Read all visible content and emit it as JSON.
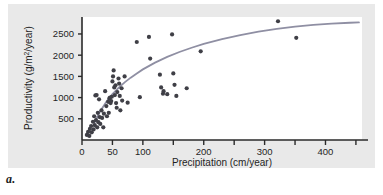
{
  "figure": {
    "panel_label": "a.",
    "background_color": "#e9e9e9",
    "plot_background_color": "#ffffff"
  },
  "chart_data": {
    "type": "scatter",
    "title": "",
    "xlabel": "Precipitation (cm/year)",
    "ylabel_parts": {
      "before": "Productivity (g/m",
      "superscript": "2",
      "after": "/year)"
    },
    "ylabel": "Productivity (g/m2/year)",
    "xlim": [
      0,
      460
    ],
    "ylim": [
      0,
      2900
    ],
    "grid": false,
    "legend": "none",
    "xticks": [
      0,
      50,
      100,
      150,
      200,
      250,
      300,
      350,
      400,
      450
    ],
    "xtick_labels": [
      "0",
      "50",
      "100",
      "",
      "200",
      "",
      "300",
      "",
      "400",
      ""
    ],
    "yticks": [
      500,
      1000,
      1500,
      2000,
      2500
    ],
    "ytick_labels": [
      "500",
      "1000",
      "1500",
      "2000",
      "2500"
    ],
    "point_color": "#3f3f46",
    "point_radius": 2.1,
    "curve_color": "#8f8fa3",
    "curve_width": 1.8,
    "axis_color": "#2a2a2a",
    "points": [
      [
        8,
        120
      ],
      [
        10,
        190
      ],
      [
        12,
        95
      ],
      [
        13,
        260
      ],
      [
        15,
        330
      ],
      [
        16,
        180
      ],
      [
        18,
        430
      ],
      [
        19,
        250
      ],
      [
        20,
        560
      ],
      [
        21,
        350
      ],
      [
        22,
        1050
      ],
      [
        23,
        470
      ],
      [
        24,
        1060
      ],
      [
        25,
        300
      ],
      [
        26,
        640
      ],
      [
        27,
        420
      ],
      [
        28,
        960
      ],
      [
        29,
        540
      ],
      [
        30,
        380
      ],
      [
        32,
        700
      ],
      [
        33,
        520
      ],
      [
        35,
        300
      ],
      [
        36,
        620
      ],
      [
        38,
        1150
      ],
      [
        40,
        800
      ],
      [
        41,
        560
      ],
      [
        43,
        900
      ],
      [
        44,
        640
      ],
      [
        45,
        980
      ],
      [
        46,
        1000
      ],
      [
        47,
        870
      ],
      [
        48,
        920
      ],
      [
        49,
        1020
      ],
      [
        50,
        1380
      ],
      [
        51,
        1500
      ],
      [
        52,
        1640
      ],
      [
        53,
        1240
      ],
      [
        54,
        1060
      ],
      [
        55,
        1290
      ],
      [
        56,
        870
      ],
      [
        57,
        760
      ],
      [
        58,
        1130
      ],
      [
        60,
        1450
      ],
      [
        61,
        1330
      ],
      [
        62,
        1040
      ],
      [
        63,
        700
      ],
      [
        65,
        1220
      ],
      [
        66,
        930
      ],
      [
        70,
        1500
      ],
      [
        75,
        880
      ],
      [
        90,
        2310
      ],
      [
        95,
        1010
      ],
      [
        110,
        2430
      ],
      [
        112,
        1920
      ],
      [
        128,
        1540
      ],
      [
        130,
        1240
      ],
      [
        133,
        1090
      ],
      [
        134,
        1150
      ],
      [
        140,
        1080
      ],
      [
        148,
        2490
      ],
      [
        150,
        1570
      ],
      [
        152,
        1300
      ],
      [
        155,
        1040
      ],
      [
        172,
        1220
      ],
      [
        195,
        2090
      ],
      [
        322,
        2800
      ],
      [
        352,
        2410
      ]
    ],
    "curve_description": "Saturating logarithmic trend line rising steeply from about (20, 400) and leveling near 2750 at the right edge.",
    "curve": [
      [
        20,
        400
      ],
      [
        30,
        680
      ],
      [
        40,
        900
      ],
      [
        50,
        1080
      ],
      [
        60,
        1230
      ],
      [
        70,
        1360
      ],
      [
        80,
        1470
      ],
      [
        90,
        1570
      ],
      [
        100,
        1665
      ],
      [
        120,
        1825
      ],
      [
        140,
        1960
      ],
      [
        160,
        2075
      ],
      [
        180,
        2175
      ],
      [
        200,
        2265
      ],
      [
        230,
        2380
      ],
      [
        260,
        2475
      ],
      [
        290,
        2555
      ],
      [
        320,
        2620
      ],
      [
        350,
        2675
      ],
      [
        380,
        2715
      ],
      [
        410,
        2745
      ],
      [
        440,
        2765
      ],
      [
        455,
        2772
      ]
    ]
  }
}
